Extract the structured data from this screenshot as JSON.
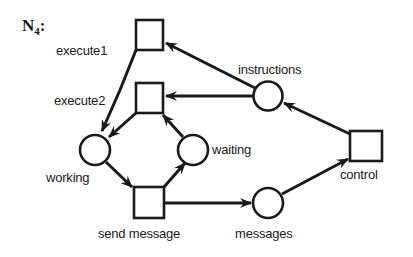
{
  "title": {
    "main": "N",
    "sub": "4",
    "suffix": ":"
  },
  "colors": {
    "stroke": "#1a1a1a",
    "fill": "#ffffff",
    "background": "#ffffff"
  },
  "nodes": {
    "execute1": {
      "type": "transition",
      "label": "execute1"
    },
    "execute2": {
      "type": "transition",
      "label": "execute2"
    },
    "instructions": {
      "type": "place",
      "label": "instructions"
    },
    "working": {
      "type": "place",
      "label": "working"
    },
    "waiting": {
      "type": "place",
      "label": "waiting"
    },
    "send_message": {
      "type": "transition",
      "label": "send message"
    },
    "messages": {
      "type": "place",
      "label": "messages"
    },
    "control": {
      "type": "transition",
      "label": "control"
    }
  },
  "edges": [
    {
      "from": "instructions",
      "to": "execute1"
    },
    {
      "from": "instructions",
      "to": "execute2"
    },
    {
      "from": "control",
      "to": "instructions"
    },
    {
      "from": "execute1",
      "to": "working"
    },
    {
      "from": "execute2",
      "to": "working"
    },
    {
      "from": "waiting",
      "to": "execute2"
    },
    {
      "from": "working",
      "to": "send_message"
    },
    {
      "from": "send_message",
      "to": "waiting"
    },
    {
      "from": "send_message",
      "to": "messages"
    },
    {
      "from": "messages",
      "to": "control"
    }
  ]
}
